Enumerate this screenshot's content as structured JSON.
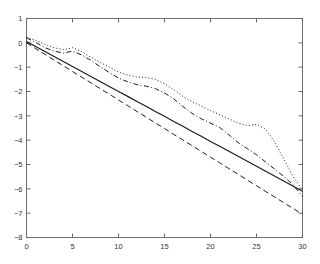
{
  "figure": {
    "title": "",
    "background_color": "#ffffff",
    "axis_color": "#6b6b6b",
    "line_color": "#1a1a1a"
  },
  "axes": {
    "x_label": "",
    "y_label": "",
    "x_ticks": [
      "0",
      "5",
      "10",
      "15",
      "20",
      "25",
      "30"
    ],
    "y_ticks": [
      "1",
      "0",
      "-1",
      "-2",
      "-3",
      "-4",
      "-5",
      "-6",
      "-7",
      "-8"
    ],
    "x_range": [
      0,
      30
    ],
    "y_range": [
      -8,
      1
    ],
    "grid": "off",
    "box": "on"
  },
  "chart_data": {
    "type": "line",
    "title": "",
    "xlabel": "",
    "ylabel": "",
    "xlim": [
      0,
      30
    ],
    "ylim": [
      -8,
      1
    ],
    "grid": false,
    "legend_position": "none",
    "x": [
      0,
      1,
      2,
      3,
      4,
      5,
      6,
      7,
      8,
      9,
      10,
      11,
      12,
      13,
      14,
      15,
      16,
      17,
      18,
      19,
      20,
      21,
      22,
      23,
      24,
      25,
      26,
      27,
      28,
      29,
      30
    ],
    "series": [
      {
        "name": "solid-line",
        "style": "solid",
        "values": [
          0.05,
          -0.15,
          -0.36,
          -0.56,
          -0.77,
          -0.97,
          -1.18,
          -1.38,
          -1.59,
          -1.79,
          -2.0,
          -2.2,
          -2.41,
          -2.61,
          -2.82,
          -3.02,
          -3.23,
          -3.43,
          -3.64,
          -3.84,
          -4.05,
          -4.25,
          -4.46,
          -4.66,
          -4.87,
          -5.07,
          -5.28,
          -5.48,
          -5.69,
          -5.89,
          -6.1
        ]
      },
      {
        "name": "dashed-line",
        "style": "dashed",
        "values": [
          0.0,
          -0.24,
          -0.47,
          -0.71,
          -0.94,
          -1.18,
          -1.41,
          -1.64,
          -1.88,
          -2.11,
          -2.35,
          -2.58,
          -2.82,
          -3.05,
          -3.29,
          -3.52,
          -3.76,
          -3.99,
          -4.23,
          -4.46,
          -4.7,
          -4.93,
          -5.17,
          -5.4,
          -5.64,
          -5.87,
          -6.11,
          -6.34,
          -6.58,
          -6.81,
          -7.05
        ]
      },
      {
        "name": "dash-dot-line",
        "style": "dashdot",
        "values": [
          0.2,
          0.02,
          -0.2,
          -0.34,
          -0.42,
          -0.34,
          -0.5,
          -0.72,
          -0.98,
          -1.22,
          -1.45,
          -1.6,
          -1.72,
          -1.78,
          -1.88,
          -2.06,
          -2.3,
          -2.62,
          -2.9,
          -3.12,
          -3.3,
          -3.48,
          -3.78,
          -4.1,
          -4.35,
          -4.6,
          -4.9,
          -5.2,
          -5.5,
          -5.85,
          -6.32
        ]
      },
      {
        "name": "dotted-line",
        "style": "dotted",
        "values": [
          0.24,
          0.1,
          -0.06,
          -0.2,
          -0.28,
          -0.2,
          -0.36,
          -0.6,
          -0.8,
          -1.0,
          -1.2,
          -1.32,
          -1.4,
          -1.42,
          -1.5,
          -1.68,
          -1.92,
          -2.2,
          -2.42,
          -2.6,
          -2.78,
          -2.96,
          -3.12,
          -3.3,
          -3.4,
          -3.35,
          -3.55,
          -4.1,
          -4.8,
          -5.5,
          -6.05
        ]
      }
    ]
  }
}
